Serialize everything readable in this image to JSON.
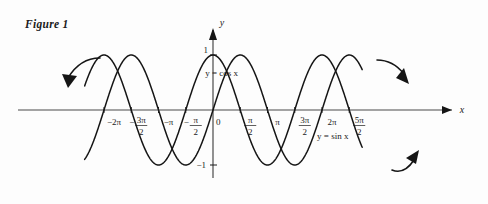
{
  "figure": {
    "caption": "Figure 1"
  },
  "chart_data": {
    "type": "line",
    "title": "Figure 1",
    "xlabel": "x",
    "ylabel": "y",
    "grid": false,
    "legend_position": "inline-annotation",
    "xlim": [
      -7.4,
      8.6
    ],
    "ylim": [
      -1.35,
      1.45
    ],
    "x_unit": "pi",
    "series": [
      {
        "name": "y = cos x",
        "label": "y = cos x",
        "function": "cos",
        "amplitude": 1,
        "period": 6.283185307,
        "phase": 0,
        "color": "#151515",
        "label_x": -0.45,
        "label_y": 0.62
      },
      {
        "name": "y = sin x",
        "label": "y = sin x",
        "function": "sin",
        "amplitude": 1,
        "period": 6.283185307,
        "phase": 0,
        "color": "#151515",
        "label_x": 6.0,
        "label_y": -0.52
      }
    ],
    "x_ticks": [
      {
        "value": -6.283185307,
        "num": "2",
        "den": "",
        "sign": "-",
        "symbol": "π",
        "label": "−2π"
      },
      {
        "value": -4.71238898,
        "num": "3π",
        "den": "2",
        "sign": "-",
        "symbol": "",
        "label": "−3π/2"
      },
      {
        "value": -3.141592653,
        "num": "",
        "den": "",
        "sign": "-",
        "symbol": "π",
        "label": "−π"
      },
      {
        "value": -1.570796326,
        "num": "π",
        "den": "2",
        "sign": "-",
        "symbol": "",
        "label": "−π/2"
      },
      {
        "value": 0,
        "num": "0",
        "den": "",
        "sign": "",
        "symbol": "",
        "label": "0"
      },
      {
        "value": 1.570796326,
        "num": "π",
        "den": "2",
        "sign": "",
        "symbol": "",
        "label": "π/2"
      },
      {
        "value": 3.141592653,
        "num": "",
        "den": "",
        "sign": "",
        "symbol": "π",
        "label": "π"
      },
      {
        "value": 4.71238898,
        "num": "3π",
        "den": "2",
        "sign": "",
        "symbol": "",
        "label": "3π/2"
      },
      {
        "value": 6.283185307,
        "num": "2",
        "den": "",
        "sign": "",
        "symbol": "π",
        "label": "2π"
      },
      {
        "value": 7.853981633,
        "num": "5π",
        "den": "2",
        "sign": "",
        "symbol": "",
        "label": "5π/2"
      }
    ],
    "y_ticks": [
      {
        "value": 1,
        "label": "1"
      },
      {
        "value": -1,
        "label": "−1"
      }
    ],
    "annotations": [
      {
        "name": "left-arrow",
        "direction": "down-left",
        "at_x": -7.0
      },
      {
        "name": "upper-right-arrow",
        "direction": "down-right",
        "at_x": 8.0
      },
      {
        "name": "lower-right-arrow",
        "direction": "up-right",
        "at_x": 8.45
      }
    ]
  }
}
